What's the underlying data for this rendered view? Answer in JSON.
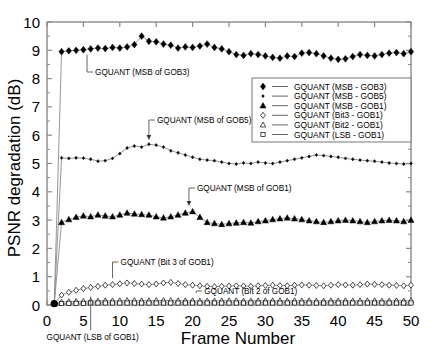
{
  "chart_data": {
    "type": "line",
    "title": "",
    "xlabel": "Frame Number",
    "ylabel": "PSNR degradation (dB)",
    "xlim": [
      0,
      50
    ],
    "ylim": [
      0,
      10
    ],
    "xticks": [
      0,
      5,
      10,
      15,
      20,
      25,
      30,
      35,
      40,
      45,
      50
    ],
    "yticks": [
      0,
      1,
      2,
      3,
      4,
      5,
      6,
      7,
      8,
      9,
      10
    ],
    "grid": false,
    "legend_position": "upper-right",
    "x": [
      1,
      2,
      3,
      4,
      5,
      6,
      7,
      8,
      9,
      10,
      11,
      12,
      13,
      14,
      15,
      16,
      17,
      18,
      19,
      20,
      21,
      22,
      23,
      24,
      25,
      26,
      27,
      28,
      29,
      30,
      31,
      32,
      33,
      34,
      35,
      36,
      37,
      38,
      39,
      40,
      41,
      42,
      43,
      44,
      45,
      46,
      47,
      48,
      49,
      50
    ],
    "series": [
      {
        "name": "GQUANT (MSB - GOB3)",
        "marker": "filled-diamond",
        "values": [
          0.05,
          8.95,
          8.98,
          9.0,
          9.02,
          9.05,
          9.08,
          9.06,
          9.1,
          9.08,
          9.12,
          9.2,
          9.5,
          9.32,
          9.3,
          9.22,
          9.18,
          9.08,
          9.12,
          9.1,
          9.15,
          9.22,
          9.1,
          9.05,
          8.95,
          8.85,
          8.82,
          8.88,
          8.85,
          8.8,
          8.75,
          8.72,
          8.8,
          8.78,
          8.9,
          8.92,
          8.88,
          8.8,
          8.72,
          8.68,
          8.7,
          8.78,
          8.85,
          8.82,
          8.8,
          8.85,
          8.9,
          8.92,
          8.88,
          8.95
        ]
      },
      {
        "name": "GQUANT (MSB - GOB5)",
        "marker": "small-dot",
        "values": [
          0.05,
          5.2,
          5.18,
          5.2,
          5.19,
          5.15,
          5.08,
          5.1,
          5.18,
          5.35,
          5.55,
          5.62,
          5.58,
          5.68,
          5.65,
          5.58,
          5.45,
          5.38,
          5.3,
          5.22,
          5.15,
          5.12,
          5.1,
          5.05,
          5.0,
          4.98,
          5.02,
          5.0,
          5.05,
          5.02,
          5.0,
          5.05,
          5.1,
          5.15,
          5.2,
          5.25,
          5.3,
          5.28,
          5.25,
          5.22,
          5.18,
          5.15,
          5.12,
          5.1,
          5.08,
          5.05,
          5.02,
          5.0,
          4.98,
          5.0
        ]
      },
      {
        "name": "GQUANT (MSB - GOB1)",
        "marker": "filled-triangle",
        "values": [
          0.05,
          2.92,
          3.02,
          3.1,
          3.15,
          3.12,
          3.18,
          3.15,
          3.12,
          3.18,
          3.25,
          3.22,
          3.2,
          3.18,
          3.12,
          3.08,
          3.12,
          3.18,
          3.25,
          3.3,
          3.1,
          2.92,
          2.88,
          2.85,
          2.88,
          2.9,
          2.92,
          2.9,
          2.95,
          2.98,
          3.02,
          3.05,
          3.08,
          3.05,
          3.02,
          2.98,
          2.95,
          2.92,
          2.95,
          2.98,
          3.0,
          2.98,
          2.95,
          2.92,
          2.95,
          2.98,
          3.0,
          2.98,
          2.95,
          3.0
        ]
      },
      {
        "name": "GQUANT (Bit3 - GOB1)",
        "marker": "open-diamond",
        "values": [
          0.05,
          0.35,
          0.45,
          0.52,
          0.58,
          0.62,
          0.66,
          0.7,
          0.72,
          0.75,
          0.78,
          0.76,
          0.74,
          0.72,
          0.74,
          0.78,
          0.8,
          0.76,
          0.72,
          0.7,
          0.68,
          0.66,
          0.65,
          0.66,
          0.67,
          0.68,
          0.67,
          0.66,
          0.68,
          0.69,
          0.7,
          0.69,
          0.68,
          0.7,
          0.71,
          0.7,
          0.69,
          0.68,
          0.7,
          0.72,
          0.71,
          0.7,
          0.72,
          0.74,
          0.73,
          0.72,
          0.7,
          0.69,
          0.68,
          0.7
        ]
      },
      {
        "name": "GQUANT (Bit2 - GOB1)",
        "marker": "open-triangle",
        "values": [
          0.05,
          0.1,
          0.12,
          0.13,
          0.13,
          0.14,
          0.14,
          0.15,
          0.15,
          0.15,
          0.16,
          0.16,
          0.15,
          0.15,
          0.16,
          0.16,
          0.16,
          0.15,
          0.15,
          0.15,
          0.14,
          0.14,
          0.14,
          0.15,
          0.15,
          0.15,
          0.14,
          0.14,
          0.15,
          0.15,
          0.15,
          0.15,
          0.14,
          0.15,
          0.15,
          0.15,
          0.14,
          0.14,
          0.15,
          0.15,
          0.15,
          0.14,
          0.15,
          0.15,
          0.15,
          0.14,
          0.14,
          0.15,
          0.14,
          0.15
        ]
      },
      {
        "name": "GQUANT (LSB - GOB1)",
        "marker": "open-square",
        "values": [
          0.03,
          0.05,
          0.06,
          0.06,
          0.06,
          0.07,
          0.07,
          0.07,
          0.07,
          0.07,
          0.07,
          0.07,
          0.07,
          0.07,
          0.07,
          0.07,
          0.07,
          0.07,
          0.07,
          0.07,
          0.07,
          0.07,
          0.07,
          0.07,
          0.07,
          0.07,
          0.07,
          0.07,
          0.07,
          0.07,
          0.07,
          0.07,
          0.07,
          0.07,
          0.07,
          0.07,
          0.07,
          0.07,
          0.07,
          0.07,
          0.07,
          0.07,
          0.07,
          0.07,
          0.07,
          0.07,
          0.07,
          0.07,
          0.07,
          0.07
        ]
      }
    ],
    "annotations": [
      {
        "text": "GQUANT (MSB of GOB3)",
        "target_x": 5.5,
        "target_y": 9.02
      },
      {
        "text": "GQUANT (MSB of GOB5)",
        "target_x": 14.0,
        "target_y": 5.7
      },
      {
        "text": "GQUANT (MSB of GOB1)",
        "target_x": 19.5,
        "target_y": 3.35
      },
      {
        "text": "GQUANT (Bit 3 of GOB1)",
        "target_x": 9.0,
        "target_y": 0.78
      },
      {
        "text": "GQUANT (Bit 2 of GOB1)",
        "target_x": 20.5,
        "target_y": 0.16
      },
      {
        "text": "GQUANT (LSB of GOB1)",
        "target_x": 6.0,
        "target_y": 0.07
      }
    ]
  },
  "legend": {
    "entries": [
      "GQUANT (MSB - GOB3)",
      "GQUANT (MSB - GOB5)",
      "GQUANT (MSB - GOB1)",
      "GQUANT (Bit3 - GOB1)",
      "GQUANT (Bit2 - GOB1)",
      "GQUANT (LSB - GOB1)"
    ]
  },
  "axes": {
    "xlabel": "Frame Number",
    "ylabel": "PSNR degradation (dB)",
    "xticklabels": [
      "0",
      "5",
      "10",
      "15",
      "20",
      "25",
      "30",
      "35",
      "40",
      "45",
      "50"
    ],
    "yticklabels": [
      "0",
      "1",
      "2",
      "3",
      "4",
      "5",
      "6",
      "7",
      "8",
      "9",
      "10"
    ]
  },
  "annotations": {
    "gob3": "GQUANT (MSB of GOB3)",
    "gob5": "GQUANT (MSB of GOB5)",
    "gob1_msb": "GQUANT (MSB of GOB1)",
    "bit3": "GQUANT (Bit 3 of GOB1)",
    "bit2": "GQUANT (Bit 2 of GOB1)",
    "lsb": "GQUANT (LSB of GOB1)"
  },
  "colors": {
    "line": "#000000",
    "axis": "#8a8a8a",
    "background": "#ffffff"
  }
}
